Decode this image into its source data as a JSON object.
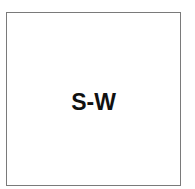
{
  "diagram": {
    "box": {
      "label": "S-W",
      "border_color": "#7a7a7a",
      "text_color": "#111111"
    }
  }
}
